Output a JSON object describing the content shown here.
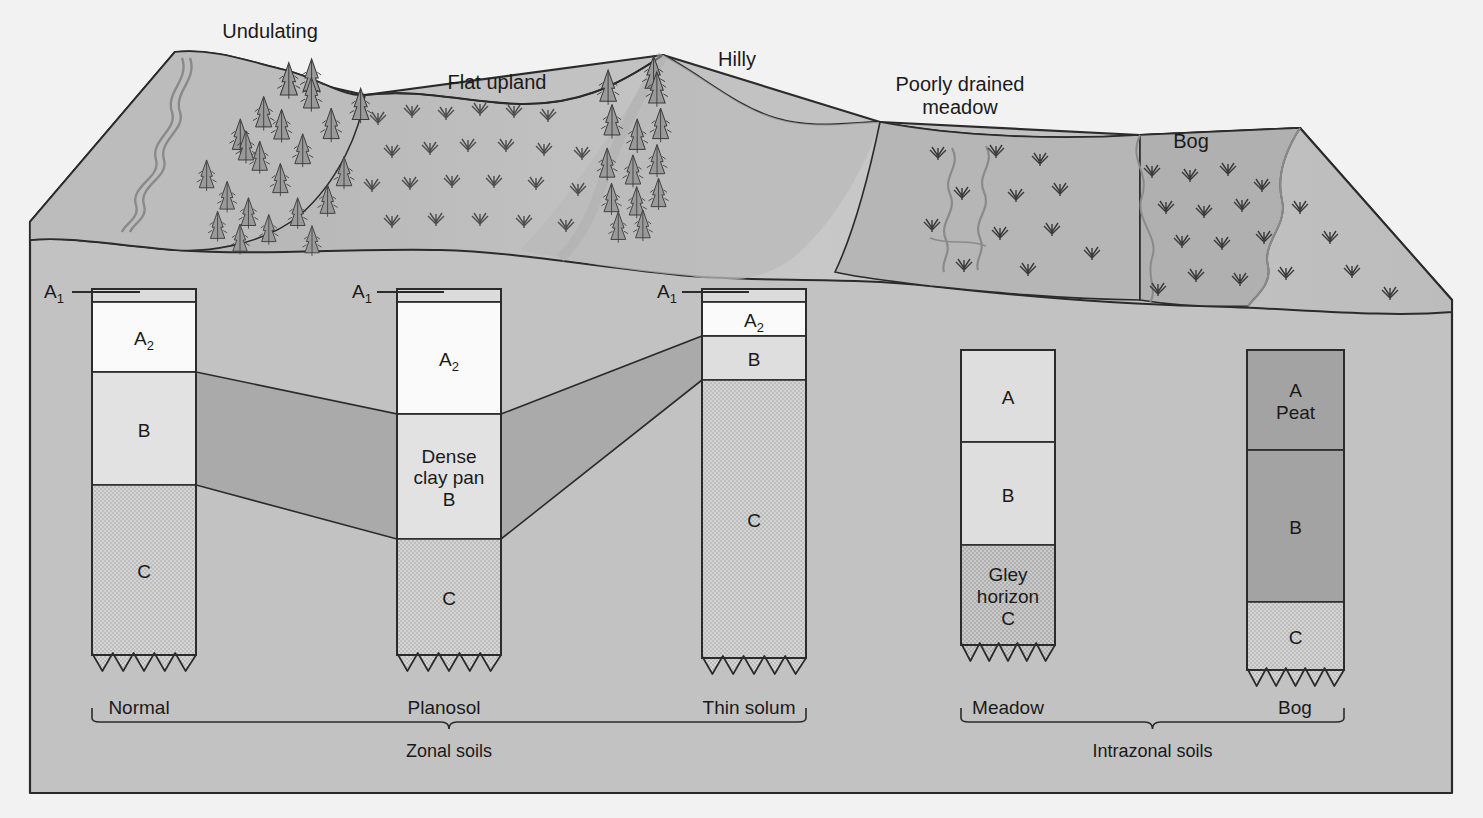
{
  "figure": {
    "kind": "soil-catena-block-diagram",
    "frame_color": "#2b2b2b",
    "background_color": "#f2f2f2",
    "block_fill": "#c2c2c2"
  },
  "landscape": {
    "labels": [
      {
        "id": "undulating",
        "text": "Undulating",
        "x": 270,
        "y": 20
      },
      {
        "id": "flat-upland",
        "text": "Flat upland",
        "x": 497,
        "y": 71
      },
      {
        "id": "hilly",
        "text": "Hilly",
        "x": 737,
        "y": 48
      },
      {
        "id": "poorly-drained-meadow",
        "text": "Poorly drained\nmeadow",
        "x": 960,
        "y": 73
      },
      {
        "id": "bog",
        "text": "Bog",
        "x": 1191,
        "y": 130
      }
    ]
  },
  "profiles": [
    {
      "id": "normal",
      "name": "Normal",
      "x": 92,
      "width": 104,
      "top": 289,
      "layers": [
        {
          "code": "A1",
          "label": "",
          "height": 13,
          "fill": "#dcdcdc",
          "texture": "plain"
        },
        {
          "code": "A2",
          "label": "A₂",
          "height": 70,
          "fill": "#fafafa",
          "texture": "plain"
        },
        {
          "code": "B",
          "label": "B",
          "height": 113,
          "fill": "#e2e2e2",
          "texture": "plain"
        },
        {
          "code": "C",
          "label": "C",
          "height": 170,
          "fill": "#d4d4d4",
          "texture": "stipple"
        }
      ],
      "has_a1_leader": true,
      "label_x": 139,
      "label_y": 697
    },
    {
      "id": "planosol",
      "name": "Planosol",
      "x": 397,
      "width": 104,
      "top": 289,
      "layers": [
        {
          "code": "A1",
          "label": "",
          "height": 13,
          "fill": "#dcdcdc",
          "texture": "plain"
        },
        {
          "code": "A2",
          "label": "A₂",
          "height": 112,
          "fill": "#fafafa",
          "texture": "plain"
        },
        {
          "code": "B",
          "label": "Dense\nclay pan\nB",
          "height": 125,
          "fill": "#e2e2e2",
          "texture": "plain"
        },
        {
          "code": "C",
          "label": "C",
          "height": 116,
          "fill": "#d4d4d4",
          "texture": "stipple"
        }
      ],
      "has_a1_leader": true,
      "label_x": 444,
      "label_y": 697
    },
    {
      "id": "thin-solum",
      "name": "Thin solum",
      "x": 702,
      "width": 104,
      "top": 289,
      "layers": [
        {
          "code": "A1",
          "label": "",
          "height": 13,
          "fill": "#dcdcdc",
          "texture": "plain"
        },
        {
          "code": "A2",
          "label": "A₂",
          "height": 34,
          "fill": "#fafafa",
          "texture": "plain"
        },
        {
          "code": "B",
          "label": "B",
          "height": 44,
          "fill": "#dedede",
          "texture": "plain"
        },
        {
          "code": "C",
          "label": "C",
          "height": 278,
          "fill": "#d4d4d4",
          "texture": "stipple"
        }
      ],
      "has_a1_leader": true,
      "label_x": 749,
      "label_y": 697
    },
    {
      "id": "meadow",
      "name": "Meadow",
      "x": 961,
      "width": 94,
      "top": 350,
      "layers": [
        {
          "code": "AB",
          "label": "A",
          "height": 92,
          "fill": "#dedede",
          "texture": "plain"
        },
        {
          "code": "AB2",
          "label": "B",
          "height": 103,
          "fill": "#dedede",
          "texture": "plain"
        },
        {
          "code": "C",
          "label": "Gley\nhorizon\nC",
          "height": 100,
          "fill": "#c9c9c9",
          "texture": "stipple"
        }
      ],
      "has_a1_leader": false,
      "label_x": 1008,
      "label_y": 697
    },
    {
      "id": "bog",
      "name": "Bog",
      "x": 1247,
      "width": 97,
      "top": 350,
      "layers": [
        {
          "code": "A",
          "label": "A\nPeat",
          "height": 100,
          "fill": "#a3a3a3",
          "texture": "plain"
        },
        {
          "code": "B",
          "label": "B",
          "height": 152,
          "fill": "#a3a3a3",
          "texture": "plain"
        },
        {
          "code": "C",
          "label": "C",
          "height": 68,
          "fill": "#cfcfcf",
          "texture": "stipple"
        }
      ],
      "has_a1_leader": false,
      "label_x": 1295,
      "label_y": 697
    }
  ],
  "axis_labels": [
    {
      "id": "a1-normal",
      "text": "A₁",
      "x": 44,
      "y": 281
    },
    {
      "id": "a1-planosol",
      "text": "A₁",
      "x": 352,
      "y": 281
    },
    {
      "id": "a1-thinsolum",
      "text": "A₁",
      "x": 657,
      "y": 281
    }
  ],
  "groups": [
    {
      "id": "zonal",
      "label": "Zonal soils",
      "left": 92,
      "right": 806,
      "y": 722,
      "label_y": 741
    },
    {
      "id": "intrazonal",
      "label": "Intrazonal soils",
      "left": 961,
      "right": 1344,
      "y": 722,
      "label_y": 741
    }
  ],
  "connecting_bands": {
    "fill": "#aaaaaa",
    "stroke": "#2b2b2b"
  }
}
